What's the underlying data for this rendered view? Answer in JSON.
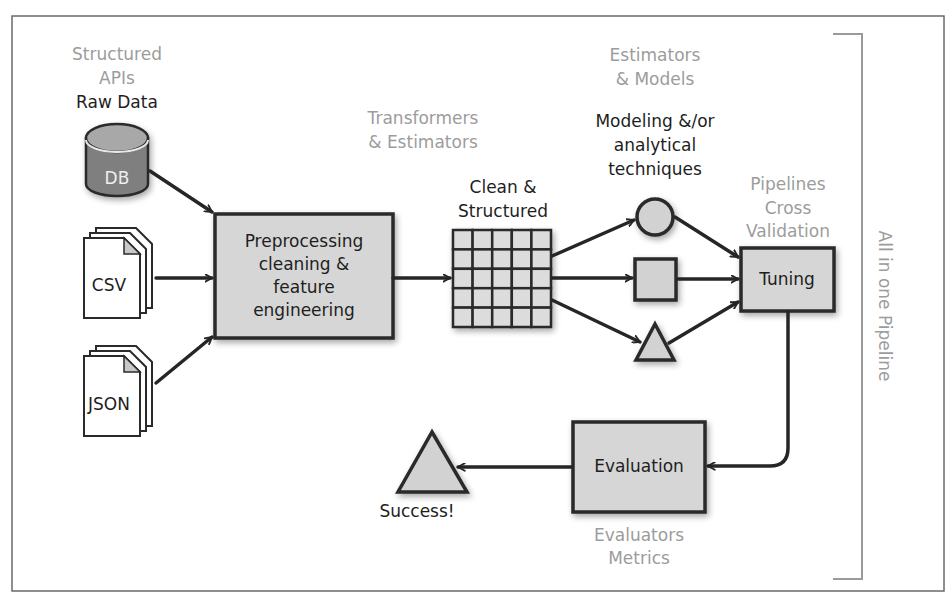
{
  "diagram": {
    "title_vertical": "All in one Pipeline",
    "colors": {
      "box_fill": "#d6d6d6",
      "stroke": "#2a2a2a",
      "gray_label": "#9c9c9c",
      "dark_label": "#1e1e1e",
      "db_body": "#7f7f7f",
      "db_top": "#a8a8a8"
    },
    "sources": {
      "header_gray": [
        "Structured",
        "APIs"
      ],
      "header_dark": "Raw Data",
      "items": [
        {
          "id": "db",
          "label": "DB",
          "icon": "database-cylinder-icon"
        },
        {
          "id": "csv",
          "label": "CSV",
          "icon": "document-stack-icon"
        },
        {
          "id": "json",
          "label": "JSON",
          "icon": "document-stack-icon"
        }
      ]
    },
    "preprocessing": {
      "lines": [
        "Preprocessing",
        "cleaning &",
        "feature",
        "engineering"
      ]
    },
    "transformers_label": [
      "Transformers",
      "& Estimators"
    ],
    "clean_data": {
      "label": [
        "Clean &",
        "Structured"
      ],
      "grid_rows": 5,
      "grid_cols": 5
    },
    "models": {
      "header_gray": [
        "Estimators",
        "& Models"
      ],
      "header_dark": [
        "Modeling &/or",
        "analytical",
        "techniques"
      ],
      "shapes": [
        "circle",
        "square",
        "triangle"
      ]
    },
    "tuning": {
      "label": "Tuning",
      "caption_gray": [
        "Pipelines",
        "Cross",
        "Validation"
      ]
    },
    "evaluation": {
      "label": "Evaluation",
      "caption_gray": [
        "Evaluators",
        "Metrics"
      ]
    },
    "success": {
      "label": "Success!"
    }
  }
}
